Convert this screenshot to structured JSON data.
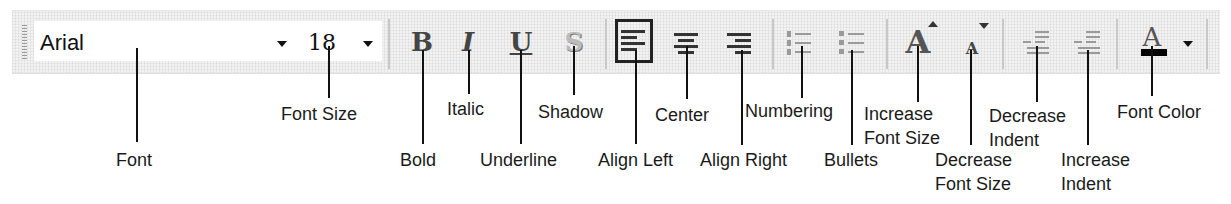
{
  "toolbar": {
    "font_name": "Arial",
    "font_size": "18",
    "font_color_swatch": "#000000",
    "buttons": [
      {
        "id": "bold",
        "glyph": "B"
      },
      {
        "id": "italic",
        "glyph": "I"
      },
      {
        "id": "underline",
        "glyph": "U"
      },
      {
        "id": "shadow",
        "glyph": "S"
      },
      {
        "id": "align-left",
        "state": "pressed"
      },
      {
        "id": "center"
      },
      {
        "id": "align-right"
      },
      {
        "id": "numbering"
      },
      {
        "id": "bullets"
      },
      {
        "id": "increase-font-size",
        "glyph": "A"
      },
      {
        "id": "decrease-font-size",
        "glyph": "A"
      },
      {
        "id": "decrease-indent"
      },
      {
        "id": "increase-indent"
      },
      {
        "id": "font-color",
        "glyph": "A"
      }
    ]
  },
  "labels": {
    "font": "Font",
    "font_size": "Font Size",
    "bold": "Bold",
    "italic": "Italic",
    "underline": "Underline",
    "shadow": "Shadow",
    "align_left": "Align Left",
    "center": "Center",
    "align_right": "Align Right",
    "numbering": "Numbering",
    "bullets": "Bullets",
    "increase_font_size_1": "Increase",
    "increase_font_size_2": "Font Size",
    "decrease_font_size_1": "Decrease",
    "decrease_font_size_2": "Font Size",
    "decrease_indent_1": "Decrease",
    "decrease_indent_2": "Indent",
    "increase_indent_1": "Increase",
    "increase_indent_2": "Indent",
    "font_color": "Font Color"
  }
}
